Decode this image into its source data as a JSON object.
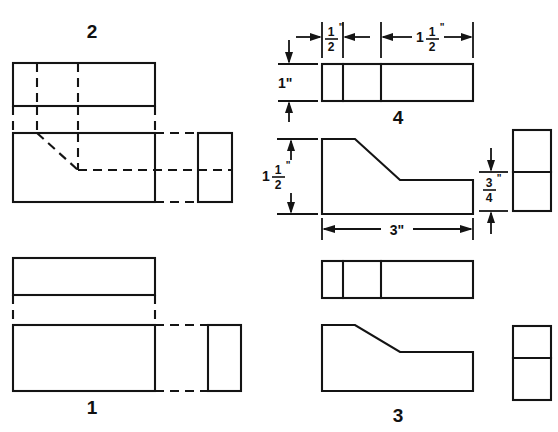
{
  "sheet": {
    "title": "Orthographic Projection Exercise",
    "background_color": "#ffffff",
    "line_color": "#141414",
    "width": 558,
    "height": 432
  },
  "views": [
    {
      "id": "view-2",
      "label": "2",
      "description": "Top-left multiview with hidden lines and chamfer shown dashed",
      "label_x": 92,
      "label_y": 38
    },
    {
      "id": "view-1",
      "label": "1",
      "description": "Bottom-left multiview with hidden lines, no chamfer visible",
      "label_x": 92,
      "label_y": 414
    },
    {
      "id": "view-4",
      "label": "4",
      "description": "Top-right dimensioned multiview with chamfered front view",
      "label_x": 398,
      "label_y": 124
    },
    {
      "id": "view-3",
      "label": "3",
      "description": "Bottom-right multiview with chamfered front view",
      "label_x": 398,
      "label_y": 422
    }
  ],
  "dimensions": [
    {
      "id": "dim-half-inch",
      "value": "1/2",
      "whole": "",
      "numerator": "1",
      "denominator": "2",
      "unit_mark": "\"",
      "display": "1/2\"",
      "orientation": "horizontal",
      "applies_to": "view-4 top view left segment width"
    },
    {
      "id": "dim-one-and-half-horizontal",
      "value": "1 1/2",
      "whole": "1",
      "numerator": "1",
      "denominator": "2",
      "unit_mark": "\"",
      "display": "1 1/2\"",
      "orientation": "horizontal",
      "applies_to": "view-4 top view right segment width"
    },
    {
      "id": "dim-one-inch",
      "value": "1",
      "whole": "1",
      "numerator": "",
      "denominator": "",
      "unit_mark": "\"",
      "display": "1\"",
      "orientation": "vertical",
      "applies_to": "view-4 top view depth"
    },
    {
      "id": "dim-one-and-half-vertical",
      "value": "1 1/2",
      "whole": "1",
      "numerator": "1",
      "denominator": "2",
      "unit_mark": "\"",
      "display": "1 1/2\"",
      "orientation": "vertical",
      "applies_to": "view-4 front view height"
    },
    {
      "id": "dim-three-inch",
      "value": "3",
      "whole": "3",
      "numerator": "",
      "denominator": "",
      "unit_mark": "\"",
      "display": "3\"",
      "orientation": "horizontal",
      "applies_to": "view-4 front view overall length"
    },
    {
      "id": "dim-three-quarter",
      "value": "3/4",
      "whole": "",
      "numerator": "3",
      "denominator": "4",
      "unit_mark": "\"",
      "display": "3/4\"",
      "orientation": "vertical",
      "applies_to": "view-4 right side view lower block height"
    }
  ]
}
